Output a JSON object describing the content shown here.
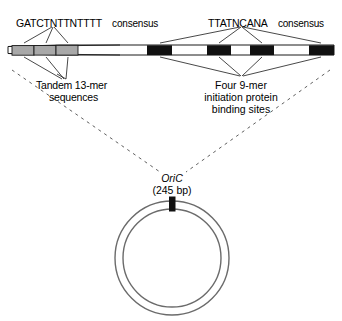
{
  "figure": {
    "background_color": "#ffffff",
    "line_color": "#1a1a1a",
    "thirteenmer_color": "#a8a8a8",
    "ninemer_color": "#111111",
    "ring_color": "#6b6b6b"
  },
  "labels": {
    "left_consensus_seq": "GATCTNTTNTTTT",
    "left_consensus_word": "consensus",
    "right_consensus_seq": "TTATNCANA",
    "right_consensus_word": "consensus",
    "left_caption_line1": "Tandem 13-mer",
    "left_caption_line2": "sequences",
    "right_caption_line1": "Four 9-mer",
    "right_caption_line2": "initiation protein",
    "right_caption_line3": "binding sites",
    "oric_name": "OriC",
    "oric_size": "(245 bp)"
  },
  "dna_map": {
    "bar_left": 8,
    "bar_right": 334,
    "bar_top": 45,
    "bar_height": 10,
    "thirteenmers": [
      {
        "name": "13-mer-1",
        "x": 12,
        "width": 22
      },
      {
        "name": "13-mer-2",
        "x": 34,
        "width": 22
      },
      {
        "name": "13-mer-3",
        "x": 56,
        "width": 22
      }
    ],
    "ninemers": [
      {
        "name": "9-mer-1",
        "x": 147,
        "width": 25
      },
      {
        "name": "9-mer-2",
        "x": 207,
        "width": 24
      },
      {
        "name": "9-mer-3",
        "x": 250,
        "width": 24
      },
      {
        "name": "9-mer-4",
        "x": 309,
        "width": 25
      }
    ]
  },
  "chromosome": {
    "center_x": 172,
    "center_y": 258,
    "outer_radius": 58,
    "inner_radius": 50,
    "tick_x": 169,
    "tick_y": 197,
    "tick_width": 6,
    "tick_height": 14
  }
}
